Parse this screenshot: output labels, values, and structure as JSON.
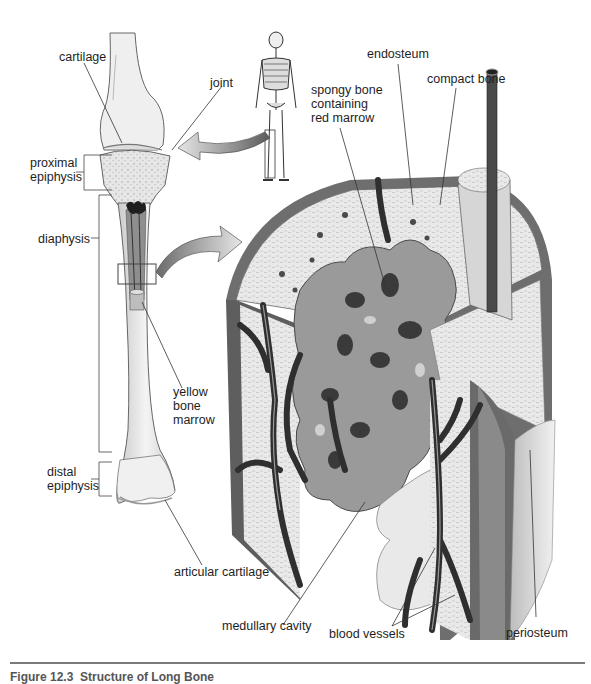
{
  "figure": {
    "type": "anatomical diagram",
    "caption": "Figure 12.3  Structure of Long Bone",
    "caption_visible": "partially cropped at bottom edge"
  },
  "labels": {
    "cartilage": "cartilage",
    "joint": "joint",
    "proximal_epiphysis": "proximal\nepiphysis",
    "diaphysis": "diaphysis",
    "yellow_bone_marrow": "yellow\nbone\nmarrow",
    "distal_epiphysis": "distal\nepiphysis",
    "articular_cartilage": "articular cartilage",
    "spongy_bone": "spongy bone\ncontaining\nred marrow",
    "endosteum": "endosteum",
    "compact_bone": "compact bone",
    "medullary_cavity": "medullary cavity",
    "blood_vessels": "blood vessels",
    "periosteum": "periosteum"
  },
  "colors": {
    "background": "#ffffff",
    "bone_light": "#ececec",
    "bone_mid": "#cfcfcf",
    "compact": "#e2e2e2",
    "periosteum": "#6e6e6e",
    "vessel": "#3a3a3a",
    "spongy": "#8c8c8c",
    "marrow_dark": "#2a2a2a",
    "arrow": "#9a9a9a",
    "leader_line": "#333333"
  }
}
